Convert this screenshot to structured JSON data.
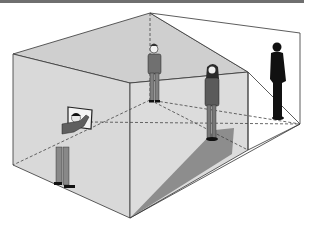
{
  "figure": {
    "colors": {
      "wall_front": "#d6d6d6",
      "wall_top": "#c8c8c8",
      "shadow": "#8a8a8a",
      "line": "#333333",
      "frame_bar": "#6f6f6f",
      "silhouette": "#111111",
      "figure_clothes": "#6b6b6b"
    },
    "elements": [
      {
        "name": "room-box",
        "label": "room box"
      },
      {
        "name": "viewer-figure",
        "label": "man holding frame"
      },
      {
        "name": "picture-frame",
        "label": "picture frame"
      },
      {
        "name": "standing-figure-back",
        "label": "standing person at back"
      },
      {
        "name": "standing-figure-corner",
        "label": "standing woman at corner"
      },
      {
        "name": "silhouette-figure",
        "label": "black silhouette"
      }
    ]
  }
}
